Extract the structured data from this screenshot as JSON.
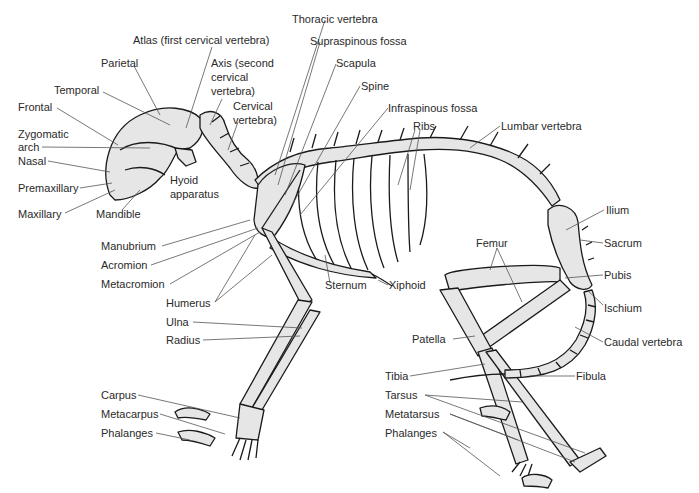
{
  "diagram": {
    "labels": [
      {
        "id": "atlas",
        "text": "Atlas (first cervical vertebra)",
        "x": 133,
        "y": 34
      },
      {
        "id": "thoracic-vertebra",
        "text": "Thoracic vertebra",
        "x": 292,
        "y": 13
      },
      {
        "id": "supraspinous-fossa",
        "text": "Supraspinous fossa",
        "x": 310,
        "y": 35
      },
      {
        "id": "parietal",
        "text": "Parietal",
        "x": 101,
        "y": 57
      },
      {
        "id": "axis-1",
        "text": "Axis (second",
        "x": 211,
        "y": 57
      },
      {
        "id": "axis-2",
        "text": "cervical",
        "x": 211,
        "y": 71
      },
      {
        "id": "axis-3",
        "text": "vertebra)",
        "x": 211,
        "y": 85
      },
      {
        "id": "scapula",
        "text": "Scapula",
        "x": 336,
        "y": 57
      },
      {
        "id": "temporal",
        "text": "Temporal",
        "x": 54,
        "y": 84
      },
      {
        "id": "spine",
        "text": "Spine",
        "x": 361,
        "y": 80
      },
      {
        "id": "cervical-1",
        "text": "Cervical",
        "x": 233,
        "y": 100
      },
      {
        "id": "cervical-2",
        "text": "vertebra)",
        "x": 233,
        "y": 114
      },
      {
        "id": "frontal",
        "text": "Frontal",
        "x": 18,
        "y": 101
      },
      {
        "id": "infraspinous-fossa",
        "text": "Infraspinous fossa",
        "x": 388,
        "y": 102
      },
      {
        "id": "ribs",
        "text": "Ribs",
        "x": 413,
        "y": 120
      },
      {
        "id": "lumbar-vertebra",
        "text": "Lumbar vertebra",
        "x": 501,
        "y": 120
      },
      {
        "id": "zygomatic-1",
        "text": "Zygomatic",
        "x": 18,
        "y": 128
      },
      {
        "id": "zygomatic-2",
        "text": "arch",
        "x": 18,
        "y": 141
      },
      {
        "id": "nasal",
        "text": "Nasal",
        "x": 18,
        "y": 155
      },
      {
        "id": "hyoid-1",
        "text": "Hyoid",
        "x": 170,
        "y": 174
      },
      {
        "id": "hyoid-2",
        "text": "apparatus",
        "x": 170,
        "y": 188
      },
      {
        "id": "premaxillary",
        "text": "Premaxillary",
        "x": 18,
        "y": 182
      },
      {
        "id": "maxillary",
        "text": "Maxillary",
        "x": 18,
        "y": 208
      },
      {
        "id": "mandible",
        "text": "Mandible",
        "x": 96,
        "y": 208
      },
      {
        "id": "ilium",
        "text": "Ilium",
        "x": 606,
        "y": 204
      },
      {
        "id": "manubrium",
        "text": "Manubrium",
        "x": 101,
        "y": 240
      },
      {
        "id": "femur",
        "text": "Femur",
        "x": 476,
        "y": 237
      },
      {
        "id": "sacrum",
        "text": "Sacrum",
        "x": 604,
        "y": 237
      },
      {
        "id": "acromion",
        "text": "Acromion",
        "x": 101,
        "y": 259
      },
      {
        "id": "sternum",
        "text": "Sternum",
        "x": 325,
        "y": 279
      },
      {
        "id": "xiphoid",
        "text": "Xiphoid",
        "x": 389,
        "y": 279
      },
      {
        "id": "pubis",
        "text": "Pubis",
        "x": 604,
        "y": 269
      },
      {
        "id": "metacromion",
        "text": "Metacromion",
        "x": 101,
        "y": 278
      },
      {
        "id": "humerus",
        "text": "Humerus",
        "x": 166,
        "y": 297
      },
      {
        "id": "ischium",
        "text": "Ischium",
        "x": 604,
        "y": 302
      },
      {
        "id": "ulna",
        "text": "Ulna",
        "x": 166,
        "y": 316
      },
      {
        "id": "patella",
        "text": "Patella",
        "x": 412,
        "y": 333
      },
      {
        "id": "caudal-vertebra",
        "text": "Caudal vertebra",
        "x": 604,
        "y": 336
      },
      {
        "id": "radius",
        "text": "Radius",
        "x": 166,
        "y": 334
      },
      {
        "id": "tibia",
        "text": "Tibia",
        "x": 385,
        "y": 370
      },
      {
        "id": "fibula",
        "text": "Fibula",
        "x": 576,
        "y": 370
      },
      {
        "id": "tarsus",
        "text": "Tarsus",
        "x": 385,
        "y": 389
      },
      {
        "id": "carpus",
        "text": "Carpus",
        "x": 101,
        "y": 389
      },
      {
        "id": "metatarsus",
        "text": "Metatarsus",
        "x": 385,
        "y": 408
      },
      {
        "id": "metacarpus",
        "text": "Metacarpus",
        "x": 101,
        "y": 408
      },
      {
        "id": "phalanges-hind",
        "text": "Phalanges",
        "x": 385,
        "y": 427
      },
      {
        "id": "phalanges-fore",
        "text": "Phalanges",
        "x": 101,
        "y": 427
      }
    ]
  }
}
